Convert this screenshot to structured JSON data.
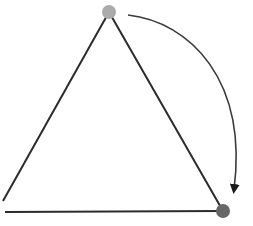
{
  "diagram": {
    "title": "",
    "colors": {
      "background": "#ffffff",
      "line": "#2b2b2b",
      "arc": "#3a3a3a",
      "top_vertex": "#ababab",
      "bottom_right_vertex": "#666666"
    },
    "vertices": [
      {
        "id": "top",
        "x": 109,
        "y": 12,
        "r": 7
      },
      {
        "id": "bottom-right",
        "x": 223,
        "y": 211,
        "r": 7
      }
    ],
    "edges": [
      {
        "id": "left-edge",
        "x1": 109,
        "y1": 12,
        "x2": 3,
        "y2": 201
      },
      {
        "id": "right-edge",
        "x1": 109,
        "y1": 12,
        "x2": 223,
        "y2": 211
      },
      {
        "id": "bottom-edge",
        "x1": 5,
        "y1": 212,
        "x2": 223,
        "y2": 211
      }
    ],
    "arrow": {
      "description": "clockwise rotation arrow from top vertex to bottom-right vertex",
      "start": {
        "x": 128,
        "y": 15
      },
      "end": {
        "x": 232,
        "y": 193
      }
    }
  }
}
